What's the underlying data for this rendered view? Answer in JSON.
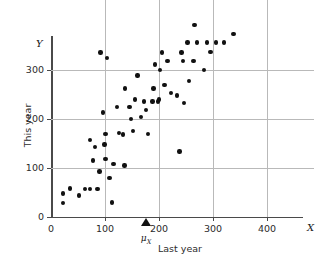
{
  "chart_data": {
    "type": "scatter",
    "title": "",
    "xlabel": "Last year",
    "ylabel": "This year",
    "x_axis_symbol": "X",
    "y_axis_symbol": "Y",
    "xlim": [
      0,
      487
    ],
    "ylim": [
      0,
      400
    ],
    "grid": true,
    "legend": "none",
    "xticks": [
      0,
      100,
      200,
      300,
      400
    ],
    "xtick_labels": [
      "0",
      "100",
      "200",
      "300",
      "400"
    ],
    "yticks": [
      0,
      100,
      200,
      300
    ],
    "ytick_labels": [
      "0",
      "100",
      "200",
      "300"
    ],
    "gridlines_x": [
      100,
      200,
      300,
      400
    ],
    "gridlines_y": [
      100,
      200,
      300
    ],
    "annotations": [
      {
        "name": "mu-x-marker",
        "label": "μX",
        "label_html": "μ<sub>X</sub>",
        "x": 176,
        "y": 0,
        "marker": "triangle-up"
      }
    ],
    "points": [
      {
        "x": 22,
        "y": 28
      },
      {
        "x": 22,
        "y": 48
      },
      {
        "x": 35,
        "y": 58
      },
      {
        "x": 52,
        "y": 44
      },
      {
        "x": 63,
        "y": 57
      },
      {
        "x": 72,
        "y": 57
      },
      {
        "x": 72,
        "y": 157
      },
      {
        "x": 78,
        "y": 115
      },
      {
        "x": 82,
        "y": 143
      },
      {
        "x": 86,
        "y": 57
      },
      {
        "x": 90,
        "y": 93
      },
      {
        "x": 92,
        "y": 336
      },
      {
        "x": 96,
        "y": 213
      },
      {
        "x": 99,
        "y": 148
      },
      {
        "x": 101,
        "y": 118
      },
      {
        "x": 101,
        "y": 169
      },
      {
        "x": 104,
        "y": 324
      },
      {
        "x": 108,
        "y": 80
      },
      {
        "x": 113,
        "y": 30
      },
      {
        "x": 116,
        "y": 108
      },
      {
        "x": 122,
        "y": 225
      },
      {
        "x": 126,
        "y": 172
      },
      {
        "x": 133,
        "y": 168
      },
      {
        "x": 136,
        "y": 105
      },
      {
        "x": 137,
        "y": 262
      },
      {
        "x": 145,
        "y": 225
      },
      {
        "x": 148,
        "y": 200
      },
      {
        "x": 152,
        "y": 176
      },
      {
        "x": 156,
        "y": 240
      },
      {
        "x": 160,
        "y": 289
      },
      {
        "x": 167,
        "y": 204
      },
      {
        "x": 172,
        "y": 236
      },
      {
        "x": 176,
        "y": 219
      },
      {
        "x": 180,
        "y": 170
      },
      {
        "x": 188,
        "y": 236
      },
      {
        "x": 190,
        "y": 262
      },
      {
        "x": 193,
        "y": 311
      },
      {
        "x": 198,
        "y": 236
      },
      {
        "x": 200,
        "y": 240
      },
      {
        "x": 202,
        "y": 300
      },
      {
        "x": 205,
        "y": 336
      },
      {
        "x": 210,
        "y": 269
      },
      {
        "x": 216,
        "y": 318
      },
      {
        "x": 222,
        "y": 253
      },
      {
        "x": 233,
        "y": 248
      },
      {
        "x": 238,
        "y": 134
      },
      {
        "x": 242,
        "y": 336
      },
      {
        "x": 244,
        "y": 318
      },
      {
        "x": 246,
        "y": 233
      },
      {
        "x": 253,
        "y": 356
      },
      {
        "x": 256,
        "y": 278
      },
      {
        "x": 264,
        "y": 318
      },
      {
        "x": 266,
        "y": 392
      },
      {
        "x": 270,
        "y": 356
      },
      {
        "x": 283,
        "y": 300
      },
      {
        "x": 289,
        "y": 356
      },
      {
        "x": 295,
        "y": 337
      },
      {
        "x": 305,
        "y": 356
      },
      {
        "x": 320,
        "y": 356
      },
      {
        "x": 338,
        "y": 374
      }
    ]
  },
  "style": {
    "point_color": "#111111",
    "grid_color": "#b9b9b9",
    "axis_color": "#4a4a4a",
    "background": "#ffffff"
  }
}
